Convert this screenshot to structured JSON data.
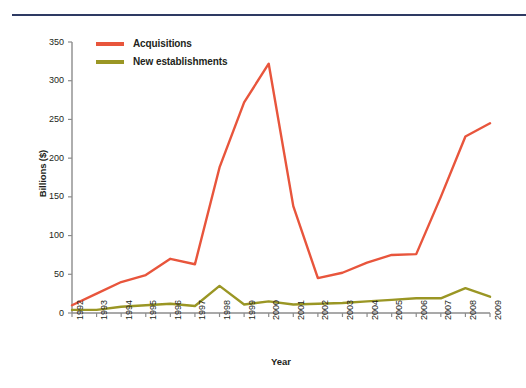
{
  "chart_data": {
    "type": "line",
    "title": "",
    "xlabel": "Year",
    "ylabel": "Billions ($)",
    "categories": [
      "1992",
      "1993",
      "1994",
      "1995",
      "1996",
      "1997",
      "1998",
      "1999",
      "2000",
      "2001",
      "2002",
      "2003",
      "2004",
      "2005",
      "2006",
      "2007",
      "2008",
      "2009"
    ],
    "series": [
      {
        "name": "Acquisitions",
        "color": "#e8553c",
        "values": [
          10,
          25,
          40,
          49,
          70,
          63,
          188,
          272,
          322,
          138,
          45,
          52,
          65,
          75,
          76,
          150,
          228,
          245
        ]
      },
      {
        "name": "New establishments",
        "color": "#9a9624",
        "values": [
          4,
          4,
          8,
          10,
          12,
          9,
          35,
          11,
          15,
          11,
          12,
          13,
          15,
          17,
          19,
          19,
          32,
          21
        ]
      }
    ],
    "ylim": [
      0,
      350
    ],
    "yticks": [
      0,
      50,
      100,
      150,
      200,
      250,
      300,
      350
    ],
    "ytick_labels": [
      "0",
      "50",
      "100",
      "150",
      "200",
      "250",
      "300",
      "350"
    ],
    "grid": false,
    "legend_position": "top-left"
  },
  "legend": {
    "items": [
      {
        "label": "Acquisitions",
        "color": "#e8553c"
      },
      {
        "label": "New establishments",
        "color": "#9a9624"
      }
    ]
  },
  "colors": {
    "rule": "#2e3a63",
    "axis": "#8c8c8c",
    "text": "#231f20"
  }
}
